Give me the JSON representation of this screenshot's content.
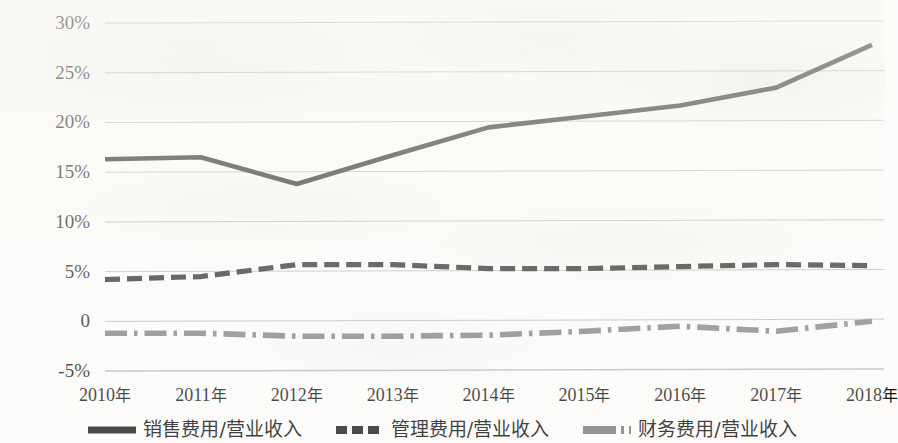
{
  "chart_data": {
    "type": "line",
    "title": "",
    "xlabel": "",
    "ylabel": "",
    "categories": [
      "2010年",
      "2011年",
      "2012年",
      "2013年",
      "2014年",
      "2015年",
      "2016年",
      "2017年",
      "2018年"
    ],
    "x": [
      2010,
      2011,
      2012,
      2013,
      2014,
      2015,
      2016,
      2017,
      2018
    ],
    "ylim": [
      -5,
      30
    ],
    "yticks": [
      30,
      25,
      20,
      15,
      10,
      5,
      0,
      -5
    ],
    "ytick_labels": [
      "30%",
      "25%",
      "20%",
      "15%",
      "10%",
      "5%",
      "0",
      "-5%"
    ],
    "grid": true,
    "legend_position": "bottom",
    "series": [
      {
        "name": "销售费用/营业收入",
        "style": "solid",
        "color": "#1a1a1a",
        "values": [
          16.2,
          16.4,
          13.7,
          16.6,
          19.4,
          20.5,
          21.6,
          23.4,
          27.7
        ]
      },
      {
        "name": "管理费用/营业收入",
        "style": "dashed",
        "color": "#1a1a1a",
        "values": [
          4.1,
          4.4,
          5.6,
          5.6,
          5.2,
          5.2,
          5.4,
          5.6,
          5.5
        ]
      },
      {
        "name": "财务费用/营业收入",
        "style": "dash-dot",
        "color": "#7a7a7a",
        "values": [
          -1.3,
          -1.3,
          -1.6,
          -1.6,
          -1.5,
          -1.1,
          -0.6,
          -1.1,
          -0.1
        ]
      }
    ]
  },
  "axis": {
    "y_tick_labels": [
      "30%",
      "25%",
      "20%",
      "15%",
      "10%",
      "5%",
      "0",
      "-5%"
    ],
    "x_tick_labels": [
      "2010年",
      "2011年",
      "2012年",
      "2013年",
      "2014年",
      "2015年",
      "2016年",
      "2017年",
      "2018年"
    ]
  },
  "legend": {
    "items": [
      {
        "label": "销售费用/营业收入",
        "style": "solid",
        "color": "#1a1a1a"
      },
      {
        "label": "管理费用/营业收入",
        "style": "dashed",
        "color": "#1a1a1a"
      },
      {
        "label": "财务费用/营业收入",
        "style": "dash-dot",
        "color": "#7a7a7a"
      }
    ]
  },
  "colors": {
    "background": "#fdfcfa",
    "gridline": "#b9b9b9",
    "series_primary": "#1a1a1a",
    "series_secondary": "#1a1a1a",
    "series_tertiary": "#7a7a7a",
    "text": "#111111"
  }
}
